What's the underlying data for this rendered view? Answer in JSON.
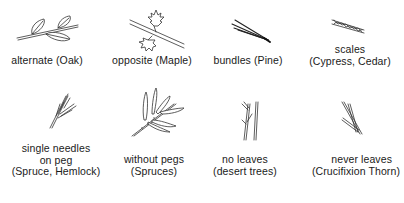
{
  "diagram": {
    "rows": [
      {
        "items": [
          {
            "id": "alternate",
            "icon": "alternate-leaves-icon",
            "lines": [
              "alternate (Oak)"
            ]
          },
          {
            "id": "opposite",
            "icon": "opposite-leaves-icon",
            "lines": [
              "opposite (Maple)"
            ]
          },
          {
            "id": "bundles",
            "icon": "needle-bundle-icon",
            "lines": [
              "bundles (Pine)"
            ]
          },
          {
            "id": "scales",
            "icon": "scale-leaves-icon",
            "lines": [
              "scales",
              "(Cypress, Cedar)"
            ]
          }
        ]
      },
      {
        "items": [
          {
            "id": "single-needles",
            "icon": "needles-on-peg-icon",
            "lines": [
              "single needles",
              "on peg",
              "(Spruce, Hemlock)"
            ]
          },
          {
            "id": "without-pegs",
            "icon": "needles-without-pegs-icon",
            "lines": [
              "without pegs",
              "(Spruces)"
            ]
          },
          {
            "id": "no-leaves",
            "icon": "leafless-twigs-icon",
            "lines": [
              "no leaves",
              "(desert trees)"
            ]
          },
          {
            "id": "never-leaves",
            "icon": "thorn-twigs-icon",
            "lines": [
              "never leaves",
              "(Crucifixion Thorn)"
            ]
          }
        ]
      }
    ],
    "colors": {
      "ink": "#1a1a1a",
      "background": "#ffffff"
    }
  }
}
